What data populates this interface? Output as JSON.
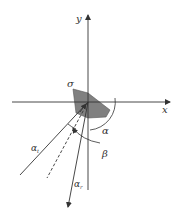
{
  "diagram": {
    "axes": {
      "x_label": "x",
      "y_label": "y"
    },
    "labels": {
      "sigma": "σ",
      "alpha": "α",
      "beta": "β",
      "alpha_t": "α",
      "alpha_t_sub": "t",
      "alpha_r": "α",
      "alpha_r_sub": "r"
    },
    "colors": {
      "line": "#333333",
      "shade": "#808080",
      "background": "#ffffff"
    }
  }
}
